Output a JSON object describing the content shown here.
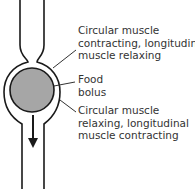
{
  "labels": {
    "top": [
      "Circular muscle",
      "contracting, longitudinal",
      "muscle relaxing"
    ],
    "middle": [
      "Food",
      "bolus"
    ],
    "bottom": [
      "Circular muscle",
      "relaxing, longitudinal",
      "muscle contracting"
    ]
  },
  "colors": {
    "bolus": "#a6a6a6",
    "stroke": "#1a1a1a",
    "leader": "#333333"
  }
}
